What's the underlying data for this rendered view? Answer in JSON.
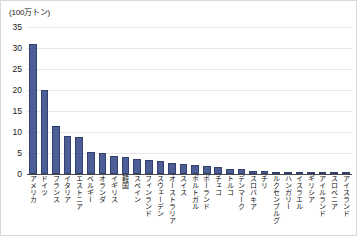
{
  "chart_data": {
    "type": "bar",
    "title": "",
    "subtitle": "",
    "unit_label": "(100万トン)",
    "xlabel": "",
    "ylabel": "",
    "ylim": [
      0,
      35
    ],
    "yticks": [
      0,
      5,
      10,
      15,
      20,
      25,
      30,
      35
    ],
    "grid": true,
    "legend": false,
    "legend_position": "none",
    "bar_color": "#4d5d96",
    "bar_border_color": "#33406e",
    "grid_color": "#e6e6e6",
    "axis_color": "#4a4a4a",
    "categories": [
      "アメリカ",
      "ドイツ",
      "フランス",
      "イタリア",
      "エストニア",
      "ベルギー",
      "オランダ",
      "イギリス",
      "韓国",
      "スペイン",
      "フィンランド",
      "スウェーデン",
      "オーストラリア",
      "スイス",
      "ポルトガル",
      "ポーランド",
      "チェコ",
      "トルコ",
      "デンマーク",
      "スロバキア",
      "チリ",
      "ルクセンブルグ",
      "ハンガリー",
      "イスラエル",
      "ギリシア",
      "アイルランド",
      "スロベニア",
      "アイスランド"
    ],
    "values": [
      31.0,
      20.0,
      11.5,
      9.0,
      8.8,
      5.2,
      5.0,
      4.2,
      4.0,
      3.6,
      3.4,
      3.2,
      2.6,
      2.4,
      2.2,
      2.0,
      1.6,
      1.3,
      1.1,
      0.7,
      0.6,
      0.5,
      0.4,
      0.3,
      0.25,
      0.2,
      0.15,
      0.1
    ]
  }
}
